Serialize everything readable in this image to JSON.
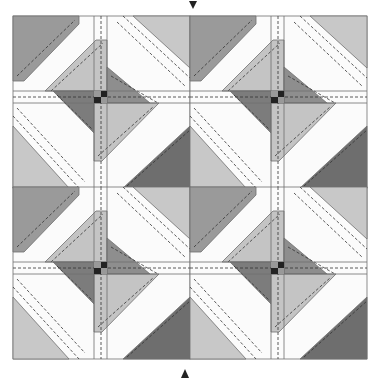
{
  "diagram": {
    "type": "quilt-block-layout",
    "grid": {
      "rows": 2,
      "cols": 2
    },
    "colors": {
      "background": "#ffffff",
      "white_strip": "#fbfbfb",
      "light": "#c4c4c4",
      "medium": "#9a9a9a",
      "dark": "#6e6e6e",
      "darkest": "#222222",
      "outline": "#707070",
      "stitch": "#333333"
    },
    "markers": [
      {
        "name": "top-arrow",
        "direction": "down"
      },
      {
        "name": "bottom-arrow",
        "direction": "up"
      }
    ]
  }
}
